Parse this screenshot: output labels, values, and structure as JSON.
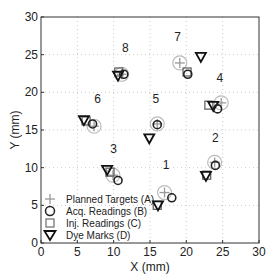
{
  "chart_data": {
    "type": "scatter",
    "title": "",
    "xlabel": "X (mm)",
    "ylabel": "Y (mm)",
    "xlim": [
      0,
      30
    ],
    "ylim": [
      0,
      30
    ],
    "xticks": [
      0,
      5,
      10,
      15,
      20,
      25,
      30
    ],
    "yticks": [
      0,
      5,
      10,
      15,
      20,
      25,
      30
    ],
    "grid": true,
    "legend_position": "lower left",
    "legend": [
      {
        "key": "A",
        "label": "Planned Targets (A)",
        "marker": "plus",
        "color": "#999999"
      },
      {
        "key": "B",
        "label": "Acq. Readings (B)",
        "marker": "circle",
        "color": "#222222"
      },
      {
        "key": "C",
        "label": "Inj. Readings (C)",
        "marker": "square",
        "color": "#666666"
      },
      {
        "key": "D",
        "label": "Dye Marks (D)",
        "marker": "triangle-down",
        "color": "#111111"
      }
    ],
    "targets": [
      {
        "id": "1",
        "A": [
          17.0,
          6.7
        ],
        "B": [
          18.0,
          6.0
        ],
        "C": [
          16.0,
          5.0
        ],
        "D": [
          16.1,
          5.0
        ],
        "label_pos": [
          17.2,
          9.8
        ]
      },
      {
        "id": "2",
        "A": [
          23.9,
          10.7
        ],
        "B": [
          24.0,
          10.3
        ],
        "C": [
          22.8,
          9.0
        ],
        "D": [
          22.7,
          8.9
        ],
        "label_pos": [
          24.0,
          13.4
        ]
      },
      {
        "id": "3",
        "A": [
          9.9,
          9.0
        ],
        "B": [
          10.6,
          8.3
        ],
        "C": [
          9.5,
          9.4
        ],
        "D": [
          9.1,
          9.7
        ],
        "label_pos": [
          10.0,
          11.9
        ]
      },
      {
        "id": "4",
        "A": [
          24.8,
          18.6
        ],
        "B": [
          24.3,
          17.8
        ],
        "C": [
          23.1,
          18.3
        ],
        "D": [
          23.7,
          18.2
        ],
        "label_pos": [
          24.6,
          21.4
        ]
      },
      {
        "id": "5",
        "A": [
          16.0,
          15.8
        ],
        "B": [
          16.0,
          15.7
        ],
        "C": null,
        "D": [
          14.9,
          13.9
        ],
        "label_pos": [
          15.8,
          18.6
        ]
      },
      {
        "id": "6",
        "A": [
          7.3,
          15.5
        ],
        "B": [
          7.1,
          15.8
        ],
        "C": [
          6.2,
          16.2
        ],
        "D": [
          5.9,
          16.3
        ],
        "label_pos": [
          7.8,
          18.6
        ]
      },
      {
        "id": "7",
        "A": [
          19.1,
          23.9
        ],
        "B": [
          20.2,
          22.4
        ],
        "C": [
          20.1,
          22.7
        ],
        "D": [
          22.0,
          24.7
        ],
        "label_pos": [
          18.8,
          26.8
        ]
      },
      {
        "id": "8",
        "A": [
          11.1,
          22.4
        ],
        "B": [
          11.4,
          22.4
        ],
        "C": [
          10.7,
          22.7
        ],
        "D": [
          10.6,
          22.2
        ],
        "label_pos": [
          11.6,
          25.4
        ]
      }
    ]
  },
  "axes": {
    "x_label": "X (mm)",
    "y_label": "Y (mm)",
    "x_ticks": [
      "0",
      "5",
      "10",
      "15",
      "20",
      "25",
      "30"
    ],
    "y_ticks": [
      "0",
      "5",
      "10",
      "15",
      "20",
      "25",
      "30"
    ]
  },
  "legend": {
    "a": "Planned Targets (A)",
    "b": "Acq. Readings (B)",
    "c": "Inj. Readings (C)",
    "d": "Dye Marks (D)"
  }
}
